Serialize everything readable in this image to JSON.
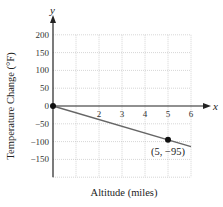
{
  "chart_data": {
    "type": "line",
    "title": "",
    "xlabel": "Altitude (miles)",
    "ylabel": "Temperature Change (°F)",
    "x_axis_name": "x",
    "y_axis_name": "y",
    "xlim": [
      0,
      6
    ],
    "ylim": [
      -200,
      200
    ],
    "x_ticks": [
      2,
      3,
      4,
      5,
      6
    ],
    "x_tick_labels": [
      "2",
      "3",
      "4",
      "5",
      "6"
    ],
    "y_ticks": [
      200,
      150,
      100,
      50,
      0,
      -50,
      -100,
      -150
    ],
    "y_tick_labels": [
      "200",
      "150",
      "100",
      "50",
      "0",
      "−50",
      "−100",
      "−150"
    ],
    "grid": true,
    "series": [
      {
        "name": "Temperature change",
        "x": [
          0,
          6
        ],
        "y": [
          0,
          -114
        ],
        "color": "#666666"
      }
    ],
    "points": [
      {
        "x": 0,
        "y": 0,
        "label": ""
      },
      {
        "x": 5,
        "y": -95,
        "label": "(5, −95)"
      }
    ],
    "legend": null
  }
}
